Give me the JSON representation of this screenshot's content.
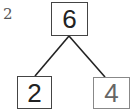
{
  "diagram": {
    "label": "2",
    "nodes": {
      "top": "6",
      "left": "2",
      "right": "4"
    },
    "edges": [
      [
        "top",
        "left"
      ],
      [
        "top",
        "right"
      ]
    ]
  }
}
